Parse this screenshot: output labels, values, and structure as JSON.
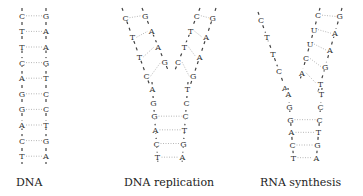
{
  "panels": [
    {
      "id": "dna",
      "caption": "DNA",
      "left_strand": [
        "C",
        "T",
        "T",
        "C",
        "A",
        "G",
        "G",
        "A",
        "C",
        "T"
      ],
      "right_strand": [
        "G",
        "A",
        "A",
        "G",
        "T",
        "C",
        "C",
        "T",
        "G",
        "A"
      ]
    },
    {
      "id": "dna-replication",
      "caption": "DNA replication",
      "fork_left_outer": [
        "C",
        "T",
        "T",
        "C"
      ],
      "fork_left_inner": [
        "G",
        "A",
        "A",
        "G"
      ],
      "fork_right_inner": [
        "C",
        "T",
        "T",
        "C"
      ],
      "fork_right_outer": [
        "G",
        "A",
        "A",
        "G"
      ],
      "stem_left": [
        "A",
        "G",
        "G",
        "A",
        "C",
        "T"
      ],
      "stem_right": [
        "T",
        "C",
        "C",
        "T",
        "G",
        "A"
      ]
    },
    {
      "id": "rna-synthesis",
      "caption": "RNA synthesis",
      "template_left": [
        "C",
        "T",
        "T",
        "C",
        "A"
      ],
      "rna_strand": [
        "C",
        "U",
        "U",
        "C",
        "A"
      ],
      "coding_right": [
        "G",
        "A",
        "A",
        "G",
        "T"
      ],
      "stem_left": [
        "A",
        "G",
        "G",
        "A",
        "C",
        "T"
      ],
      "stem_right": [
        "T",
        "C",
        "C",
        "T",
        "G",
        "A"
      ]
    }
  ],
  "colors": {
    "backbone": "#444444",
    "bond": "#999999",
    "text": "#222222"
  }
}
